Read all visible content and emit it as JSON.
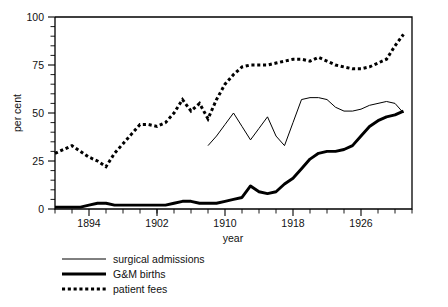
{
  "chart_data": {
    "type": "line",
    "title": "",
    "xlabel": "year",
    "ylabel": "per cent",
    "xlim": [
      1890,
      1932
    ],
    "ylim": [
      0,
      100
    ],
    "grid": false,
    "legend_position": "below-left",
    "x_ticks_major": [
      1894,
      1902,
      1910,
      1918,
      1926
    ],
    "x_tick_labels": [
      "1894",
      "1902",
      "1910",
      "1918",
      "1926"
    ],
    "x_tick_minor_step": 2,
    "y_ticks_major": [
      0,
      25,
      50,
      75,
      100
    ],
    "y_tick_labels": [
      "0",
      "25",
      "50",
      "75",
      "100"
    ],
    "y_tick_minor_step": 5,
    "series": [
      {
        "name": "surgical admissions",
        "style": "thin-solid",
        "x": [
          1908,
          1909,
          1910,
          1911,
          1912,
          1913,
          1914,
          1915,
          1916,
          1917,
          1918,
          1919,
          1920,
          1921,
          1922,
          1923,
          1924,
          1925,
          1926,
          1927,
          1928,
          1929,
          1930,
          1931
        ],
        "y": [
          33,
          38,
          44,
          50,
          43,
          36,
          42,
          48,
          38,
          33,
          45,
          57,
          58,
          58,
          57,
          53,
          51,
          51,
          52,
          54,
          55,
          56,
          55,
          50
        ]
      },
      {
        "name": "G&M births",
        "style": "thick-solid",
        "x": [
          1890,
          1891,
          1892,
          1893,
          1894,
          1895,
          1896,
          1897,
          1898,
          1899,
          1900,
          1901,
          1902,
          1903,
          1904,
          1905,
          1906,
          1907,
          1908,
          1909,
          1910,
          1911,
          1912,
          1913,
          1914,
          1915,
          1916,
          1917,
          1918,
          1919,
          1920,
          1921,
          1922,
          1923,
          1924,
          1925,
          1926,
          1927,
          1928,
          1929,
          1930,
          1931
        ],
        "y": [
          1,
          1,
          1,
          1,
          2,
          3,
          3,
          2,
          2,
          2,
          2,
          2,
          2,
          2,
          3,
          4,
          4,
          3,
          3,
          3,
          4,
          5,
          6,
          12,
          9,
          8,
          9,
          13,
          16,
          21,
          26,
          29,
          30,
          30,
          31,
          33,
          38,
          43,
          46,
          48,
          49,
          51
        ]
      },
      {
        "name": "patient fees",
        "style": "dotted",
        "x": [
          1890,
          1891,
          1892,
          1893,
          1894,
          1895,
          1896,
          1897,
          1898,
          1899,
          1900,
          1901,
          1902,
          1903,
          1904,
          1905,
          1906,
          1907,
          1908,
          1909,
          1910,
          1911,
          1912,
          1913,
          1914,
          1915,
          1916,
          1917,
          1918,
          1919,
          1920,
          1921,
          1922,
          1923,
          1924,
          1925,
          1926,
          1927,
          1928,
          1929,
          1930,
          1931
        ],
        "y": [
          29,
          31,
          33,
          30,
          27,
          25,
          22,
          29,
          34,
          39,
          44,
          44,
          43,
          45,
          50,
          57,
          51,
          55,
          47,
          57,
          65,
          70,
          74,
          75,
          75,
          75,
          76,
          77,
          78,
          78,
          77,
          79,
          77,
          75,
          74,
          73,
          73,
          74,
          76,
          78,
          85,
          91
        ]
      }
    ]
  },
  "legend": {
    "items": [
      {
        "label": "surgical admissions",
        "style": "thin-solid"
      },
      {
        "label": "G&M births",
        "style": "thick-solid"
      },
      {
        "label": "patient fees",
        "style": "dotted"
      }
    ]
  },
  "axes": {
    "y_title": "per cent",
    "x_title": "year"
  }
}
